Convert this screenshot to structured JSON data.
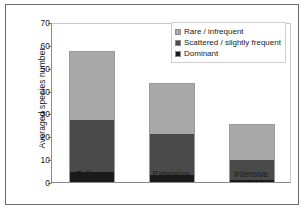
{
  "chart_data": {
    "type": "bar",
    "subtype": "stacked-bar",
    "title": "",
    "xlabel": "",
    "ylabel": "Averaged species number",
    "categories": [
      "Fallows",
      "Extensive",
      "Intensive"
    ],
    "ylim": [
      0,
      70
    ],
    "yticks": [
      0,
      10,
      20,
      30,
      40,
      50,
      60,
      70
    ],
    "ytick_labels": [
      "0",
      "10",
      "20",
      "30",
      "40",
      "50",
      "60",
      "70"
    ],
    "grid": false,
    "legend_position": "upper-right",
    "stacking_order_bottom_to_top": [
      "Dominant",
      "Scattered / slightly frequent",
      "Rare / infrequent"
    ],
    "series": [
      {
        "name": "Dominant",
        "color": "#1a1a1a",
        "values": [
          4.5,
          3.0,
          1.0
        ]
      },
      {
        "name": "Scattered / slightly frequent",
        "color": "#4a4a4a",
        "values": [
          23.0,
          18.3,
          9.0
        ]
      },
      {
        "name": "Rare / infrequent",
        "color": "#a8a8a8",
        "values": [
          30.0,
          22.2,
          15.5
        ]
      }
    ],
    "totals": [
      57.5,
      43.5,
      25.5
    ]
  },
  "legend": {
    "items": [
      {
        "label": "Rare / infrequent",
        "color": "#a8a8a8"
      },
      {
        "label": "Scattered / slightly frequent",
        "color": "#4a4a4a"
      },
      {
        "label": "Dominant",
        "color": "#1a1a1a"
      }
    ]
  },
  "axis": {
    "y_title": "Averaged species number"
  }
}
